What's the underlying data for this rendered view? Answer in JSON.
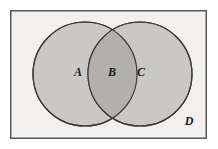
{
  "figure": {
    "width": 218,
    "height": 149,
    "background_color": "#ffffff"
  },
  "universe": {
    "label": "D",
    "label_x": 189,
    "label_y": 122,
    "rect": {
      "x": 10,
      "y": 10,
      "width": 197,
      "height": 129
    },
    "fill_color": "#f1f0ee",
    "border_color": "#575757",
    "border_width": 1.5
  },
  "circles": [
    {
      "name": "left-circle",
      "label": "A",
      "cx": 85,
      "cy": 74,
      "r": 52,
      "fill_color": "#cac8c5",
      "stroke_color": "#3a3a3a",
      "stroke_width": 1.2,
      "label_x": 78,
      "label_y": 73
    },
    {
      "name": "right-circle",
      "label": "C",
      "cx": 140,
      "cy": 74,
      "r": 52,
      "fill_color": "#cac8c5",
      "stroke_color": "#3a3a3a",
      "stroke_width": 1.2,
      "label_x": 141,
      "label_y": 73
    }
  ],
  "intersection": {
    "name": "overlap-region",
    "label": "B",
    "label_x": 112,
    "label_y": 73,
    "fill_color": "#b2b0ad",
    "top_point": {
      "x": 112,
      "y": 33
    },
    "bottom_point": {
      "x": 112,
      "y": 115
    }
  },
  "labels": [
    {
      "id": "label-a",
      "text": "A"
    },
    {
      "id": "label-b",
      "text": "B"
    },
    {
      "id": "label-c",
      "text": "C"
    },
    {
      "id": "label-d",
      "text": "D"
    }
  ]
}
